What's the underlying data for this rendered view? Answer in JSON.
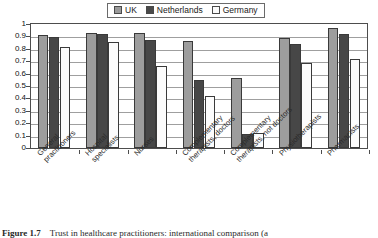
{
  "chart_data": {
    "type": "bar",
    "title": "",
    "xlabel": "",
    "ylabel": "",
    "ylim": [
      0,
      1
    ],
    "ytick_labels": [
      "1",
      "0.9",
      "0.8",
      "0.7",
      "0.6",
      "0.5",
      "0.4",
      "0.3",
      "0.2",
      "0.1",
      "0"
    ],
    "ytick_values": [
      1,
      0.9,
      0.8,
      0.7,
      0.6,
      0.5,
      0.4,
      0.3,
      0.2,
      0.1,
      0
    ],
    "grid": true,
    "legend_position": "top-center",
    "categories": [
      "General practitioners",
      "Hospital specialists",
      "Nurses",
      "Complementary therapists, doctors",
      "Complementary therapists, not doctors",
      "Physiotherapists",
      "Pharmacists"
    ],
    "series": [
      {
        "name": "UK",
        "color": "#9d9d9d",
        "values": [
          0.91,
          0.93,
          0.93,
          0.865,
          0.565,
          0.89,
          0.965
        ]
      },
      {
        "name": "Netherlands",
        "color": "#474747",
        "values": [
          0.895,
          0.92,
          0.875,
          0.545,
          0.11,
          0.835,
          0.92
        ]
      },
      {
        "name": "Germany",
        "color": "#fcfcfc",
        "values": [
          0.815,
          0.855,
          0.66,
          0.42,
          0.125,
          0.685,
          0.715
        ]
      }
    ]
  },
  "legend": {
    "items": [
      {
        "label": "UK",
        "swatch": "uk"
      },
      {
        "label": "Netherlands",
        "swatch": "nl"
      },
      {
        "label": "Germany",
        "swatch": "de"
      }
    ]
  },
  "caption": {
    "number": "Figure 1.7",
    "text": "Trust in healthcare practitioners: international comparison (a"
  }
}
